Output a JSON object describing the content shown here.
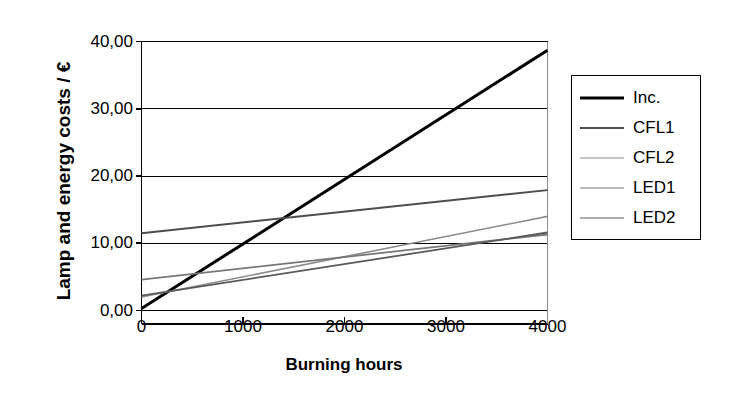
{
  "chart_data": {
    "type": "line",
    "title": "",
    "xlabel": "Burning hours",
    "ylabel": "Lamp and energy costs / €",
    "xlim": [
      0,
      4000
    ],
    "ylim": [
      0,
      40
    ],
    "grid": true,
    "legend_position": "right",
    "x": [
      0,
      4000
    ],
    "x_tick_labels": [
      "0",
      "1000",
      "2000",
      "3000",
      "4000"
    ],
    "y_tick_labels": [
      "0,00",
      "10,00",
      "20,00",
      "30,00",
      "40,00"
    ],
    "y_ticks": [
      0,
      10,
      20,
      30,
      40
    ],
    "x_ticks": [
      0,
      1000,
      2000,
      3000,
      4000
    ],
    "series": [
      {
        "name": "Inc.",
        "values": [
          0.3,
          38.7
        ],
        "color": "#000000",
        "width": 3.0
      },
      {
        "name": "CFL1",
        "values": [
          11.5,
          17.9
        ],
        "color": "#4d4d4d",
        "width": 2.0
      },
      {
        "name": "CFL2",
        "values": [
          2.0,
          14.0
        ],
        "color": "#8c8c8c",
        "width": 1.6
      },
      {
        "name": "LED1",
        "values": [
          4.6,
          11.3
        ],
        "color": "#787878",
        "width": 1.8
      },
      {
        "name": "LED2",
        "values": [
          2.2,
          11.6
        ],
        "color": "#5a5a5a",
        "width": 1.8
      }
    ]
  },
  "axes": {
    "y_title": "Lamp and energy costs / €",
    "x_title": "Burning hours"
  },
  "legend": {
    "items": [
      {
        "label": "Inc."
      },
      {
        "label": "CFL1"
      },
      {
        "label": "CFL2"
      },
      {
        "label": "LED1"
      },
      {
        "label": "LED2"
      }
    ]
  }
}
